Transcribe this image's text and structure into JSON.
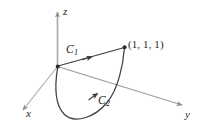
{
  "figure": {
    "kind": "3d-coordinate-axes-diagram",
    "background_color": "#ffffff",
    "ink_color": "#231f20",
    "axis_color": "#a6a6a6",
    "curve_color": "#3f3f3f",
    "axes": [
      {
        "name": "z",
        "label": "z",
        "direction": "up",
        "arrow": true
      },
      {
        "name": "x",
        "label": "x",
        "direction": "down-left",
        "arrow": true
      },
      {
        "name": "y",
        "label": "y",
        "direction": "down-right",
        "arrow": true
      }
    ],
    "points": [
      {
        "name": "origin",
        "label": "",
        "marker": "dot"
      },
      {
        "name": "target-point",
        "label": "(1, 1, 1)",
        "marker": "dot"
      }
    ],
    "curves": [
      {
        "name": "C1",
        "label": "C",
        "subscript": "1",
        "shape": "straight-segment",
        "from": "origin",
        "to": "(1, 1, 1)",
        "arrow": true
      },
      {
        "name": "C2",
        "label": "C",
        "subscript": "2",
        "shape": "loop-arc",
        "from": "origin",
        "to": "(1, 1, 1)",
        "arrow": true
      }
    ]
  },
  "labels": {
    "z": "z",
    "x": "x",
    "y": "y",
    "c1": "C",
    "c1_sub": "1",
    "c2": "C",
    "c2_sub": "2",
    "point": "(1, 1, 1)"
  }
}
